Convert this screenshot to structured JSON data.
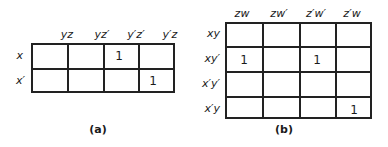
{
  "map_a": {
    "caption": "(a)",
    "columns": [
      "yz",
      "yz′",
      "y′z′",
      "y′z"
    ],
    "rows": [
      "x",
      "x′"
    ],
    "cells": [
      [
        "",
        "",
        "1",
        ""
      ],
      [
        "",
        "",
        "",
        "1"
      ]
    ]
  },
  "map_b": {
    "caption": "(b)",
    "columns": [
      "zw",
      "zw′",
      "z′w′",
      "z′w"
    ],
    "rows": [
      "xy",
      "xy′",
      "x′y′",
      "x′y"
    ],
    "cells": [
      [
        "",
        "",
        "",
        ""
      ],
      [
        "1",
        "",
        "1",
        ""
      ],
      [
        "",
        "",
        "",
        ""
      ],
      [
        "",
        "",
        "",
        "1"
      ]
    ]
  }
}
